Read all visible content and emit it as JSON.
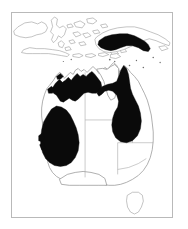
{
  "figure": {
    "type": "distribution-map",
    "region": "Australia and New Guinea",
    "background_color": "#ffffff",
    "frame_color": "#b9b9b9",
    "coastline_color": "#8d8d8d",
    "state_border_color": "#a8a8a8",
    "range_fill_color": "#0a0a0a",
    "caption": ""
  },
  "legend": {
    "range_label": "Recorded distribution",
    "range_swatch_color": "#0a0a0a"
  },
  "landmasses": [
    {
      "name": "Australia",
      "label": ""
    },
    {
      "name": "New Guinea",
      "label": ""
    },
    {
      "name": "Borneo",
      "label": ""
    },
    {
      "name": "Sulawesi",
      "label": ""
    },
    {
      "name": "Java",
      "label": ""
    },
    {
      "name": "Lesser Sunda Islands",
      "label": ""
    },
    {
      "name": "Tasmania",
      "label": ""
    }
  ],
  "state_borders": [
    {
      "name": "Western Australia / Northern Territory"
    },
    {
      "name": "Northern Territory / Queensland"
    },
    {
      "name": "Western Australia / South Australia"
    },
    {
      "name": "South Australia / Queensland"
    },
    {
      "name": "South Australia / New South Wales"
    },
    {
      "name": "New South Wales / Victoria"
    }
  ],
  "range_patches": [
    {
      "name": "new-guinea-patch",
      "region": "Southern New Guinea",
      "fill": "#0a0a0a"
    },
    {
      "name": "kimberley-top-end-patch",
      "region": "Kimberley and Top End",
      "fill": "#0a0a0a"
    },
    {
      "name": "cape-york-queensland-patch",
      "region": "Cape York and Queensland",
      "fill": "#0a0a0a"
    },
    {
      "name": "southwest-australia-patch",
      "region": "South-west Western Australia",
      "fill": "#0a0a0a"
    }
  ]
}
